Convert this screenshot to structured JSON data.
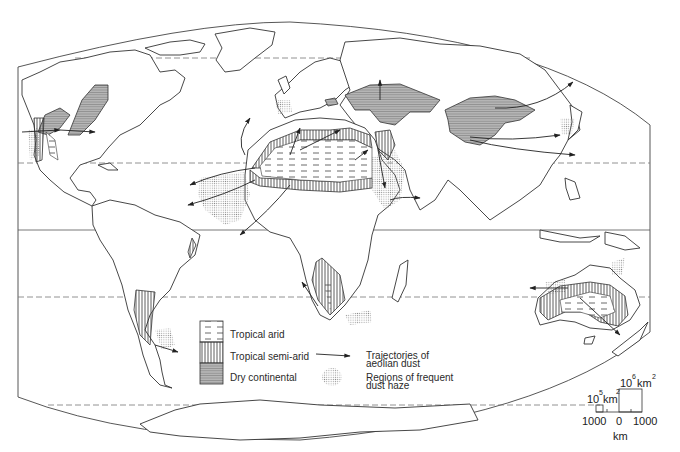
{
  "figure": {
    "type": "world-map"
  },
  "legend": {
    "items": [
      {
        "key": "tropical_arid",
        "label": "Tropical arid",
        "pattern": "dashed-horizontal"
      },
      {
        "key": "tropical_semi_arid",
        "label": "Tropical semi-arid",
        "pattern": "vertical-hatch"
      },
      {
        "key": "dry_continental",
        "label": "Dry continental",
        "pattern": "horizontal-hatch-grey"
      },
      {
        "key": "trajectories",
        "label_line1": "Trajectories of",
        "label_line2": "aeolian dust",
        "symbol": "arrow"
      },
      {
        "key": "dust_haze",
        "label_line1": "Regions of frequent",
        "label_line2": "dust haze",
        "symbol": "stipple"
      }
    ]
  },
  "scale": {
    "area_small_base": "10",
    "area_small_exp": "5",
    "area_small_unit": "km",
    "area_small_unit_exp": "2",
    "area_large_base": "10",
    "area_large_exp": "6",
    "area_large_unit": "km",
    "area_large_unit_exp": "2",
    "ticks": [
      "1000",
      "0",
      "1000"
    ],
    "unit": "km"
  },
  "colors": {
    "line": "#333333",
    "dry_continental_fill": "#a8a8a8",
    "stipple": "#bdbdbd",
    "background": "#ffffff"
  }
}
